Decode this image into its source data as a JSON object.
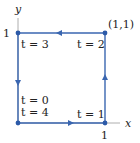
{
  "diagram": {
    "axes": {
      "x_label": "x",
      "y_label": "y",
      "x_tick": "1",
      "y_tick": "1"
    },
    "corner_label": "(1,1)",
    "vertices": [
      {
        "name": "origin",
        "labels": [
          "t = 0",
          "t = 4"
        ]
      },
      {
        "name": "bottom-right",
        "label": "t = 1"
      },
      {
        "name": "top-right",
        "label": "t = 2"
      },
      {
        "name": "top-left",
        "label": "t = 3"
      }
    ],
    "path_color": "#3a66b0",
    "axis_color": "#888888"
  }
}
